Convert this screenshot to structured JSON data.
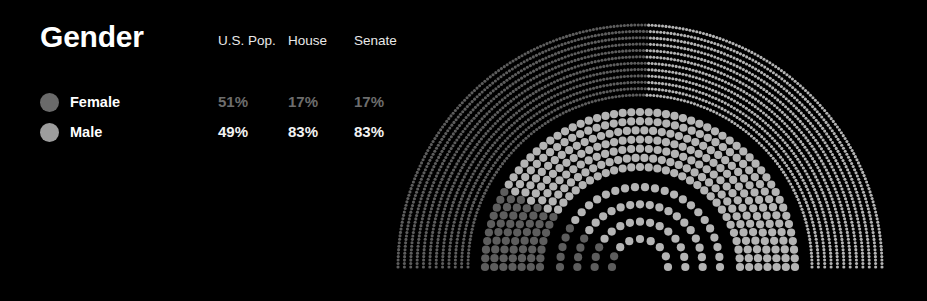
{
  "panel": {
    "title": "Gender",
    "columns": [
      "U.S. Pop.",
      "House",
      "Senate"
    ],
    "rows": [
      {
        "label": "Female",
        "dot_color": "#6a6a6a",
        "values": [
          "51%",
          "17%",
          "17%"
        ],
        "value_color": "#6d6d6d"
      },
      {
        "label": "Male",
        "dot_color": "#9d9d9d",
        "values": [
          "49%",
          "83%",
          "83%"
        ],
        "value_color": "#f2f2f2"
      }
    ]
  },
  "colors": {
    "background": "#000000",
    "title": "#ffffff",
    "header": "#e9e9e9",
    "female_dot": "#5d5d5d",
    "male_dot": "#b4b4b4"
  },
  "chart_data": {
    "type": "pie",
    "title": "Gender",
    "xlabel": "",
    "ylabel": "",
    "legend_position": "left",
    "grid": false,
    "arc_style": "nested semicircular dot arcs (parliament / wheel-of-dots)",
    "orientation": "semicircle, 180 degrees, opening downward",
    "fill_order": "left to right along each arc; female segment first",
    "categories": [
      "Female",
      "Male"
    ],
    "arcs": [
      {
        "name": "U.S. Pop.",
        "ring": "outer",
        "dot_count_approx": 2000,
        "dot_rows": 12,
        "values": [
          51,
          49
        ],
        "labels": [
          "51%",
          "17%"
        ],
        "series": [
          {
            "name": "Female",
            "value": 51,
            "color": "#5d5d5d"
          },
          {
            "name": "Male",
            "value": 49,
            "color": "#b4b4b4"
          }
        ]
      },
      {
        "name": "House",
        "ring": "middle",
        "dot_count_approx": 435,
        "dot_rows": 7,
        "values": [
          17,
          83
        ],
        "labels": [
          "17%",
          "83%"
        ],
        "series": [
          {
            "name": "Female",
            "value": 17,
            "color": "#5d5d5d"
          },
          {
            "name": "Male",
            "value": 83,
            "color": "#b4b4b4"
          }
        ]
      },
      {
        "name": "Senate",
        "ring": "inner",
        "dot_count_approx": 100,
        "dot_rows": 4,
        "values": [
          17,
          83
        ],
        "labels": [
          "17%",
          "83%"
        ],
        "series": [
          {
            "name": "Female",
            "value": 17,
            "color": "#5d5d5d"
          },
          {
            "name": "Male",
            "value": 83,
            "color": "#b4b4b4"
          }
        ]
      }
    ]
  }
}
